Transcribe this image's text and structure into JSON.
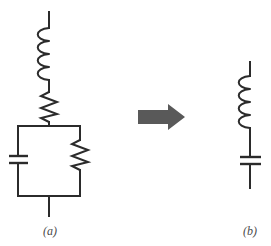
{
  "figure": {
    "width": 271,
    "height": 246,
    "background_color": "#ffffff",
    "line_color": "#2b2b2b",
    "arrow_color": "#595959",
    "caption_color": "#4a4a4a"
  },
  "circuit_a": {
    "caption": "(a)",
    "description": "Inductor in series with a resistor, feeding a parallel capacitor-resistor combination",
    "components": [
      {
        "name": "inductor",
        "symbol": "coil",
        "turns": 4,
        "orientation": "vertical",
        "bulge": "left"
      },
      {
        "name": "resistor-series",
        "symbol": "zigzag",
        "peaks": 6,
        "orientation": "vertical"
      },
      {
        "name": "capacitor-parallel",
        "symbol": "two-plates",
        "orientation": "horizontal-plates",
        "branch": "left"
      },
      {
        "name": "resistor-parallel",
        "symbol": "zigzag",
        "peaks": 6,
        "orientation": "vertical",
        "branch": "right"
      }
    ],
    "nodes": {
      "top_terminal_y": 12,
      "box_top_y": 126,
      "box_bottom_y": 196,
      "box_left_x": 18,
      "box_right_x": 80,
      "main_wire_x": 49,
      "bottom_terminal_y": 216
    }
  },
  "circuit_b": {
    "caption": "(b)",
    "description": "Equivalent series inductor and capacitor",
    "components": [
      {
        "name": "inductor",
        "symbol": "coil",
        "turns": 4,
        "orientation": "vertical",
        "bulge": "left"
      },
      {
        "name": "capacitor",
        "symbol": "two-plates",
        "orientation": "horizontal-plates"
      }
    ],
    "nodes": {
      "top_terminal_y": 62,
      "bottom_terminal_y": 188,
      "main_wire_x": 250
    }
  },
  "arrow": {
    "name": "equivalence-arrow",
    "direction": "right",
    "color": "#595959",
    "x": 138,
    "y": 104,
    "width": 47,
    "height": 26
  }
}
